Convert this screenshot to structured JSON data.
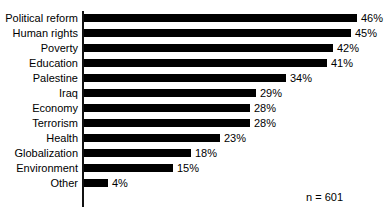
{
  "chart_data": {
    "type": "bar",
    "orientation": "horizontal",
    "title": "",
    "subtitle": "",
    "xlabel": "",
    "ylabel": "",
    "xlim": [
      0,
      46
    ],
    "grid": false,
    "legend": null,
    "value_suffix": "%",
    "annotations": [
      {
        "name": "sample-size",
        "text": "n = 601"
      }
    ],
    "categories": [
      "Political reform",
      "Human rights",
      "Poverty",
      "Education",
      "Palestine",
      "Iraq",
      "Economy",
      "Terrorism",
      "Health",
      "Globalization",
      "Environment",
      "Other"
    ],
    "values": [
      46,
      45,
      42,
      41,
      34,
      29,
      28,
      28,
      23,
      18,
      15,
      4
    ],
    "value_labels": [
      "46%",
      "45%",
      "42%",
      "41%",
      "34%",
      "29%",
      "28%",
      "28%",
      "23%",
      "18%",
      "15%",
      "4%"
    ],
    "bar_color": "#000000",
    "axis_color": "#111111",
    "background_color": "#ffffff"
  }
}
